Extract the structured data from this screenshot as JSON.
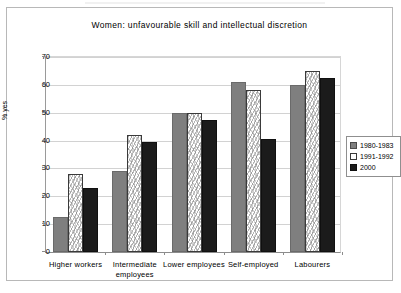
{
  "chart_data": {
    "type": "bar",
    "title": "Women: unfavourable skill and intellectual discretion",
    "xlabel": "",
    "ylabel": "% yes",
    "ylim": [
      0,
      70
    ],
    "ytick_step": 10,
    "yticks": [
      "0",
      "10",
      "20",
      "30",
      "40",
      "50",
      "60",
      "70"
    ],
    "grid": true,
    "legend_position": "right",
    "categories": [
      "Higher workers",
      "Intermediate employees",
      "Lower employees",
      "Self-employed",
      "Labourers"
    ],
    "series": [
      {
        "name": "1980-1983",
        "color": "#7f7f7f",
        "values": [
          12.5,
          29,
          50,
          61,
          60
        ]
      },
      {
        "name": "1991-1992",
        "color": "#ffffff",
        "values": [
          28,
          42,
          50,
          58,
          65
        ]
      },
      {
        "name": "2000",
        "color": "#1b1b1b",
        "values": [
          23,
          39.5,
          47.5,
          40.5,
          62.5
        ]
      }
    ]
  },
  "legend": {
    "items": [
      {
        "label": "1980-1983"
      },
      {
        "label": "1991-1992"
      },
      {
        "label": "2000"
      }
    ]
  }
}
